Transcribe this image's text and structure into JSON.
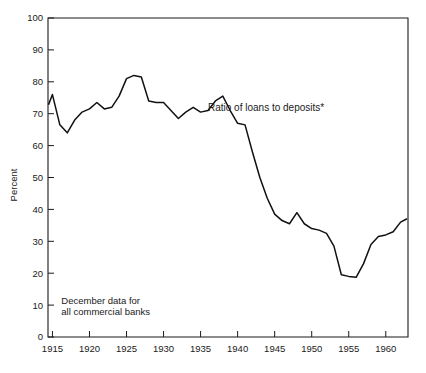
{
  "chart_data": {
    "type": "line",
    "title": "",
    "xlabel": "",
    "ylabel": "Percent",
    "xlim": [
      1914.4,
      1963.0
    ],
    "ylim": [
      0,
      100
    ],
    "grid": false,
    "legend_position": "none",
    "x_ticks": [
      1915,
      1920,
      1925,
      1930,
      1935,
      1940,
      1945,
      1950,
      1955,
      1960
    ],
    "x_tick_labels": [
      "1915",
      "1920",
      "1925",
      "1930",
      "1935",
      "1940",
      "1945",
      "1950",
      "1955",
      "1960"
    ],
    "y_ticks": [
      0,
      10,
      20,
      30,
      40,
      50,
      60,
      70,
      80,
      90,
      100
    ],
    "y_tick_labels": [
      "0",
      "10",
      "20",
      "30",
      "40",
      "50",
      "60",
      "70",
      "80",
      "90",
      "100"
    ],
    "annotations": [
      {
        "name": "series-annotation",
        "text": "Ratio of loans to deposits*",
        "x": 1936.0,
        "y": 71.0
      },
      {
        "name": "source-note-line-1",
        "text": "December data for",
        "x": 1916.2,
        "y": 10.5
      },
      {
        "name": "source-note-line-2",
        "text": "all commercial banks",
        "x": 1916.2,
        "y": 7.0
      }
    ],
    "series": [
      {
        "name": "Ratio of loans to deposits",
        "color": "#111111",
        "x": [
          1914.5,
          1915,
          1916,
          1917,
          1918,
          1919,
          1920,
          1921,
          1922,
          1923,
          1924,
          1925,
          1926,
          1927,
          1928,
          1929,
          1930,
          1931,
          1932,
          1933,
          1934,
          1935,
          1936,
          1937,
          1938,
          1939,
          1940,
          1941,
          1942,
          1943,
          1944,
          1945,
          1946,
          1947,
          1948,
          1949,
          1950,
          1951,
          1952,
          1953,
          1954,
          1955,
          1956,
          1957,
          1958,
          1959,
          1960,
          1961,
          1962,
          1962.8
        ],
        "values": [
          73.0,
          76.0,
          66.5,
          64.0,
          68.0,
          70.5,
          71.5,
          73.5,
          71.5,
          72.0,
          75.5,
          81.0,
          82.0,
          81.5,
          74.0,
          73.5,
          73.5,
          71.0,
          68.5,
          70.5,
          72.0,
          70.5,
          71.0,
          74.0,
          75.5,
          71.0,
          67.0,
          66.5,
          58.0,
          50.0,
          43.5,
          38.5,
          36.5,
          35.5,
          39.0,
          35.5,
          34.0,
          33.5,
          32.5,
          28.5,
          19.5,
          19.0,
          18.7,
          23.0,
          29.0,
          31.5,
          32.0,
          33.0,
          36.0,
          37.0
        ]
      }
    ],
    "series_points_note": "December annual observations, percent of deposits"
  },
  "axis": {
    "y_title": "Percent"
  }
}
